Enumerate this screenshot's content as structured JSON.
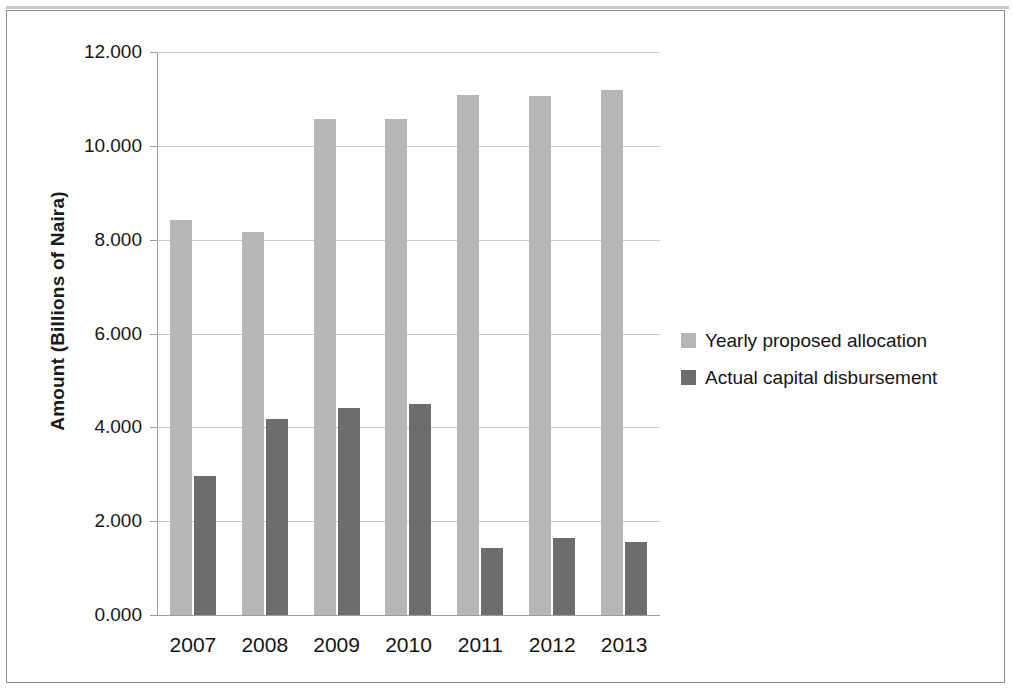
{
  "chart_data": {
    "type": "bar",
    "title": "",
    "xlabel": "",
    "ylabel": "Amount (Billions of Naira)",
    "categories": [
      "2007",
      "2008",
      "2009",
      "2010",
      "2011",
      "2012",
      "2013"
    ],
    "series": [
      {
        "name": "Yearly proposed allocation",
        "color": "#b6b6b6",
        "values": [
          8.42,
          8.17,
          10.58,
          10.58,
          11.08,
          11.07,
          11.19
        ]
      },
      {
        "name": "Actual capital disbursement",
        "color": "#6d6d6d",
        "values": [
          2.96,
          4.18,
          4.41,
          4.5,
          1.43,
          1.64,
          1.56
        ]
      }
    ],
    "ylim": [
      0,
      12
    ],
    "ytick_labels": [
      "0.000",
      "2.000",
      "4.000",
      "6.000",
      "8.000",
      "10.000",
      "12.000"
    ],
    "ytick_values": [
      0,
      2,
      4,
      6,
      8,
      10,
      12
    ],
    "grid": true,
    "legend_position": "right"
  },
  "legend": {
    "items": [
      {
        "label": "Yearly proposed allocation",
        "swatch": "light"
      },
      {
        "label": "Actual capital disbursement",
        "swatch": "dark"
      }
    ]
  }
}
